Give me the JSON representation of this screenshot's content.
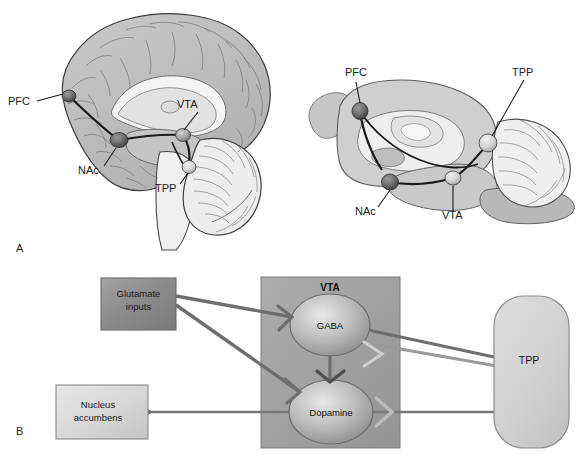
{
  "figure": {
    "panels": [
      {
        "id": "A",
        "label": "A",
        "caption_x": 16,
        "caption_y": 252
      },
      {
        "id": "B",
        "label": "B",
        "caption_x": 16,
        "caption_y": 435
      }
    ]
  },
  "panel_a": {
    "human_brain": {
      "name": "human brain midsagittal section",
      "labels": [
        {
          "text": "PFC",
          "x": 8,
          "y": 105,
          "anchor": "start"
        },
        {
          "text": "NAc",
          "x": 78,
          "y": 174,
          "anchor": "start"
        },
        {
          "text": "VTA",
          "x": 177,
          "y": 108,
          "anchor": "start"
        },
        {
          "text": "TPP",
          "x": 155,
          "y": 192,
          "anchor": "start"
        }
      ],
      "nuclei": [
        {
          "name": "PFC",
          "cx": 69,
          "cy": 96,
          "rx": 7,
          "ry": 6,
          "shade": "dark"
        },
        {
          "name": "NAc",
          "cx": 119,
          "cy": 140,
          "rx": 9,
          "ry": 7.5,
          "shade": "dark"
        },
        {
          "name": "VTA",
          "cx": 183,
          "cy": 135,
          "rx": 7.5,
          "ry": 6.5,
          "shade": "mid"
        },
        {
          "name": "TPP",
          "cx": 189,
          "cy": 167,
          "rx": 7,
          "ry": 6.5,
          "shade": "light"
        }
      ]
    },
    "rat_brain": {
      "name": "rat brain midsagittal section",
      "labels": [
        {
          "text": "PFC",
          "x": 345,
          "y": 76,
          "anchor": "start"
        },
        {
          "text": "TPP",
          "x": 512,
          "y": 76,
          "anchor": "start"
        },
        {
          "text": "NAc",
          "x": 355,
          "y": 215,
          "anchor": "start"
        },
        {
          "text": "VTA",
          "x": 442,
          "y": 219,
          "anchor": "start"
        }
      ],
      "nuclei": [
        {
          "name": "PFC",
          "cx": 360,
          "cy": 111,
          "rx": 8,
          "ry": 8.5,
          "shade": "dark"
        },
        {
          "name": "NAc",
          "cx": 390,
          "cy": 182,
          "rx": 8.5,
          "ry": 8,
          "shade": "dark"
        },
        {
          "name": "VTA",
          "cx": 453,
          "cy": 178,
          "rx": 8,
          "ry": 7,
          "shade": "light"
        },
        {
          "name": "TPP",
          "cx": 488,
          "cy": 143,
          "rx": 9,
          "ry": 9,
          "shade": "light"
        }
      ]
    }
  },
  "panel_b": {
    "name": "VTA circuitry schematic",
    "nodes": [
      {
        "id": "glutamate",
        "label_line1": "Glutamate",
        "label_line2": "inputs",
        "shape": "rect",
        "x": 101,
        "y": 278,
        "w": 75,
        "h": 52,
        "fill": "#8e8e8e"
      },
      {
        "id": "nucleus-accumbens",
        "label_line1": "Nucleus",
        "label_line2": "accumbens",
        "shape": "rect",
        "x": 56,
        "y": 385,
        "w": 92,
        "h": 54,
        "fill": "#d9d9d9"
      },
      {
        "id": "vta-region",
        "label_line1": "VTA",
        "label_line2": "",
        "shape": "rect",
        "x": 261,
        "y": 277,
        "w": 139,
        "h": 171,
        "fill": "#a2a2a2"
      },
      {
        "id": "tpp",
        "label_line1": "TPP",
        "label_line2": "",
        "shape": "stadium",
        "x": 494,
        "y": 296,
        "w": 75,
        "h": 152,
        "fill": "#d2d2d2"
      }
    ],
    "cells": [
      {
        "id": "gaba",
        "label": "GABA",
        "cx": 330,
        "cy": 325,
        "rx": 40,
        "ry": 31
      },
      {
        "id": "dopamine",
        "label": "Dopamine",
        "cx": 331,
        "cy": 412,
        "rx": 42,
        "ry": 32
      }
    ],
    "connections": [
      {
        "id": "glutamate-to-gaba",
        "from": "glutamate",
        "to": "gaba",
        "terminal": "synapse"
      },
      {
        "id": "glutamate-to-dopamine",
        "from": "glutamate",
        "to": "dopamine",
        "terminal": "synapse"
      },
      {
        "id": "gaba-to-dopamine",
        "from": "gaba",
        "to": "dopamine",
        "terminal": "synapse"
      },
      {
        "id": "nucleus-accumbens-to-dopamine",
        "from": "dopamine",
        "to": "nucleus-accumbens",
        "terminal": "synapse"
      },
      {
        "id": "gaba-to-tpp",
        "from": "gaba",
        "to": "tpp",
        "terminal": "synapse"
      },
      {
        "id": "tpp-to-gaba",
        "from": "tpp",
        "to": "gaba",
        "terminal": "synapse"
      },
      {
        "id": "tpp-to-dopamine",
        "from": "tpp",
        "to": "dopamine",
        "terminal": "synapse"
      }
    ],
    "colors": {
      "line": "#6e6e6e",
      "line_dark": "#5a5a5a",
      "box_stroke": "#6b6b6b",
      "glutamate_fill": "#8e8e8e",
      "nac_fill": "#d9d9d9",
      "vta_fill": "#a2a2a2",
      "tpp_fill": "#d2d2d2"
    }
  }
}
